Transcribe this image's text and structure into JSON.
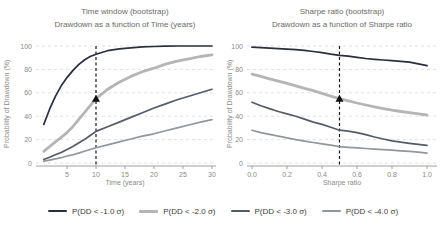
{
  "legend": {
    "items": [
      {
        "label": "P(DD < -1.0 σ)",
        "color": "#2b2e3e",
        "thick": false
      },
      {
        "label": "P(DD < -2.0 σ)",
        "color": "#b5b5b5",
        "thick": true
      },
      {
        "label": "P(DD < -3.0 σ)",
        "color": "#545b69",
        "thick": false
      },
      {
        "label": "P(DD < -4.0 σ)",
        "color": "#92979c",
        "thick": false
      }
    ]
  },
  "chart_data": [
    {
      "type": "line",
      "title": "Time window (bootstrap)",
      "subtitle": "Drawdown as a function of Time (years)",
      "xlabel": "Time (years)",
      "ylabel": "Probability of Drawdown (%)",
      "xlim": [
        0,
        31
      ],
      "ylim": [
        0,
        100
      ],
      "xticks": [
        5,
        10,
        15,
        20,
        25,
        30
      ],
      "xtick_labels": [
        "5",
        "10",
        "15",
        "20",
        "25",
        "30"
      ],
      "yticks": [
        0,
        20,
        40,
        60,
        80,
        100
      ],
      "ytick_labels": [
        "0",
        "20",
        "40",
        "60",
        "80",
        "100"
      ],
      "grid": "horizontal-dashed",
      "legend_position": "bottom",
      "vline_x": 10,
      "marker": {
        "x": 10,
        "y": 55,
        "shape": "triangle-up",
        "color": "#111111"
      },
      "x": [
        1,
        2,
        3,
        4,
        5,
        6,
        7,
        8,
        9,
        10,
        12,
        14,
        16,
        18,
        20,
        22,
        24,
        26,
        28,
        30
      ],
      "series": [
        {
          "name": "P(DD < -1.0 σ)",
          "color": "#2b2e3e",
          "width": 1.7,
          "values": [
            33,
            46,
            57,
            66,
            73,
            79,
            84,
            88,
            91,
            93,
            96,
            97.5,
            98.5,
            99.2,
            99.6,
            99.8,
            100,
            100,
            100,
            100
          ]
        },
        {
          "name": "P(DD < -2.0 σ)",
          "color": "#b5b5b5",
          "width": 2.8,
          "values": [
            10,
            14,
            18,
            22,
            26,
            31,
            37,
            43,
            49,
            55,
            63,
            69,
            74,
            78,
            81,
            84.5,
            87,
            89,
            91,
            92.5
          ]
        },
        {
          "name": "P(DD < -3.0 σ)",
          "color": "#545b69",
          "width": 1.7,
          "values": [
            3,
            5,
            7,
            9,
            11.5,
            14,
            17,
            20,
            23.5,
            27,
            31,
            35,
            39,
            43,
            47,
            50.5,
            54,
            57,
            60,
            63
          ]
        },
        {
          "name": "P(DD < -4.0 σ)",
          "color": "#92979c",
          "width": 1.7,
          "values": [
            1.5,
            2.5,
            3.5,
            4.5,
            6,
            7,
            8.5,
            10,
            11.5,
            13,
            15.5,
            18,
            20.5,
            23,
            25,
            27.5,
            30,
            32.5,
            35,
            37
          ]
        }
      ]
    },
    {
      "type": "line",
      "title": "Sharpe ratio (bootstrap)",
      "subtitle": "Drawdown as a function of Sharpe ratio",
      "xlabel": "Sharpe ratio",
      "ylabel": "Probability of Drawdown (%)",
      "xlim": [
        0,
        1.05
      ],
      "ylim": [
        0,
        100
      ],
      "xticks": [
        0,
        0.2,
        0.4,
        0.6,
        0.8,
        1.0
      ],
      "xtick_labels": [
        "0.0",
        "0.2",
        "0.4",
        "0.6",
        "0.8",
        "1.0"
      ],
      "yticks": [
        0,
        20,
        40,
        60,
        80,
        100
      ],
      "ytick_labels": [
        "0",
        "20",
        "40",
        "60",
        "80",
        "100"
      ],
      "grid": "horizontal-dashed",
      "legend_position": "bottom",
      "vline_x": 0.5,
      "marker": {
        "x": 0.5,
        "y": 55,
        "shape": "triangle-up",
        "color": "#111111"
      },
      "x": [
        0,
        0.05,
        0.1,
        0.15,
        0.2,
        0.25,
        0.3,
        0.35,
        0.4,
        0.45,
        0.5,
        0.55,
        0.6,
        0.65,
        0.7,
        0.75,
        0.8,
        0.85,
        0.9,
        0.95,
        1.0
      ],
      "series": [
        {
          "name": "P(DD < -1.0 σ)",
          "color": "#2b2e3e",
          "width": 1.7,
          "values": [
            99,
            98.6,
            98.2,
            97.8,
            97.3,
            96.8,
            96.2,
            95.3,
            94.3,
            93,
            92,
            91.3,
            90.3,
            89.3,
            88.6,
            88,
            87.4,
            86.8,
            86.2,
            84.8,
            83.2
          ]
        },
        {
          "name": "P(DD < -2.0 σ)",
          "color": "#b5b5b5",
          "width": 2.8,
          "values": [
            76,
            74,
            72,
            70,
            68,
            66,
            63.8,
            61.8,
            59.5,
            57.2,
            55,
            53.2,
            51.3,
            49.6,
            48,
            46.5,
            45.2,
            44,
            43,
            42,
            41
          ]
        },
        {
          "name": "P(DD < -3.0 σ)",
          "color": "#545b69",
          "width": 1.7,
          "values": [
            52,
            49,
            46.5,
            44,
            42,
            40,
            37.5,
            35,
            33,
            30.5,
            28,
            27.2,
            26,
            24.3,
            22.2,
            20.5,
            19,
            17.8,
            16.8,
            16,
            15
          ]
        },
        {
          "name": "P(DD < -4.0 σ)",
          "color": "#92979c",
          "width": 1.7,
          "values": [
            28,
            26,
            24.5,
            23,
            21.5,
            20,
            18.7,
            17.5,
            16.3,
            15.2,
            14,
            13.4,
            12.9,
            12.4,
            11.9,
            11.4,
            10.9,
            10.4,
            10,
            9.3,
            8.5
          ]
        }
      ]
    }
  ]
}
